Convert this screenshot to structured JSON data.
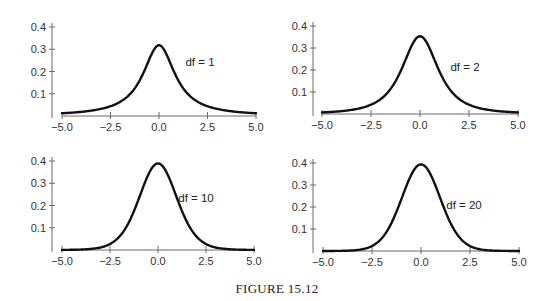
{
  "figure": {
    "caption": "FIGURE 15.12"
  },
  "chart_data": [
    {
      "type": "line",
      "title": "",
      "annotation": "df = 1",
      "df": 1,
      "distribution": "Student t density",
      "xlabel": "",
      "ylabel": "",
      "xlim": [
        -5.0,
        5.0
      ],
      "ylim": [
        0,
        0.4
      ],
      "x_ticks": [
        -5.0,
        -2.5,
        0.0,
        2.5,
        5.0
      ],
      "x_tick_labels": [
        "−5.0",
        "−2.5",
        "0.0",
        "2.5",
        "5.0"
      ],
      "y_ticks": [
        0.1,
        0.2,
        0.3,
        0.4
      ],
      "y_tick_labels": [
        "0.1",
        "0.2",
        "0.3",
        "0.4"
      ],
      "grid": false,
      "legend": "none",
      "x": [
        -5.0,
        -4.0,
        -3.0,
        -2.5,
        -2.0,
        -1.5,
        -1.0,
        -0.5,
        0.0,
        0.5,
        1.0,
        1.5,
        2.0,
        2.5,
        3.0,
        4.0,
        5.0
      ],
      "y": [
        0.012,
        0.019,
        0.032,
        0.044,
        0.064,
        0.098,
        0.159,
        0.255,
        0.318,
        0.255,
        0.159,
        0.098,
        0.064,
        0.044,
        0.032,
        0.019,
        0.012
      ]
    },
    {
      "type": "line",
      "title": "",
      "annotation": "df = 2",
      "df": 2,
      "distribution": "Student t density",
      "xlabel": "",
      "ylabel": "",
      "xlim": [
        -5.0,
        5.0
      ],
      "ylim": [
        0,
        0.4
      ],
      "x_ticks": [
        -5.0,
        -2.5,
        0.0,
        2.5,
        5.0
      ],
      "x_tick_labels": [
        "−5.0",
        "−2.5",
        "0.0",
        "2.5",
        "5.0"
      ],
      "y_ticks": [
        0.1,
        0.2,
        0.3,
        0.4
      ],
      "y_tick_labels": [
        "0.1",
        "0.2",
        "0.3",
        "0.4"
      ],
      "grid": false,
      "legend": "none",
      "x": [
        -5.0,
        -4.0,
        -3.0,
        -2.5,
        -2.0,
        -1.5,
        -1.0,
        -0.5,
        0.0,
        0.5,
        1.0,
        1.5,
        2.0,
        2.5,
        3.0,
        4.0,
        5.0
      ],
      "y": [
        0.007,
        0.013,
        0.027,
        0.042,
        0.068,
        0.117,
        0.192,
        0.299,
        0.354,
        0.299,
        0.192,
        0.117,
        0.068,
        0.042,
        0.027,
        0.013,
        0.007
      ]
    },
    {
      "type": "line",
      "title": "",
      "annotation": "df = 10",
      "df": 10,
      "distribution": "Student t density",
      "xlabel": "",
      "ylabel": "",
      "xlim": [
        -5.0,
        5.0
      ],
      "ylim": [
        0,
        0.4
      ],
      "x_ticks": [
        -5.0,
        -2.5,
        0.0,
        2.5,
        5.0
      ],
      "x_tick_labels": [
        "−5.0",
        "−2.5",
        "0.0",
        "2.5",
        "5.0"
      ],
      "y_ticks": [
        0.1,
        0.2,
        0.3,
        0.4
      ],
      "y_tick_labels": [
        "0.1",
        "0.2",
        "0.3",
        "0.4"
      ],
      "grid": false,
      "legend": "none",
      "x": [
        -5.0,
        -4.0,
        -3.0,
        -2.5,
        -2.0,
        -1.5,
        -1.0,
        -0.5,
        0.0,
        0.5,
        1.0,
        1.5,
        2.0,
        2.5,
        3.0,
        4.0,
        5.0
      ],
      "y": [
        0.0,
        0.002,
        0.011,
        0.025,
        0.061,
        0.127,
        0.23,
        0.34,
        0.389,
        0.34,
        0.23,
        0.127,
        0.061,
        0.025,
        0.011,
        0.002,
        0.0
      ]
    },
    {
      "type": "line",
      "title": "",
      "annotation": "df = 20",
      "df": 20,
      "distribution": "Student t density",
      "xlabel": "",
      "ylabel": "",
      "xlim": [
        -5.0,
        5.0
      ],
      "ylim": [
        0,
        0.4
      ],
      "x_ticks": [
        -5.0,
        -2.5,
        0.0,
        2.5,
        5.0
      ],
      "x_tick_labels": [
        "−5.0",
        "−2.5",
        "0.0",
        "2.5",
        "5.0"
      ],
      "y_ticks": [
        0.1,
        0.2,
        0.3,
        0.4
      ],
      "y_tick_labels": [
        "0.1",
        "0.2",
        "0.3",
        "0.4"
      ],
      "grid": false,
      "legend": "none",
      "x": [
        -5.0,
        -4.0,
        -3.0,
        -2.5,
        -2.0,
        -1.5,
        -1.0,
        -0.5,
        0.0,
        0.5,
        1.0,
        1.5,
        2.0,
        2.5,
        3.0,
        4.0,
        5.0
      ],
      "y": [
        0.0,
        0.001,
        0.007,
        0.021,
        0.058,
        0.128,
        0.236,
        0.347,
        0.394,
        0.347,
        0.236,
        0.128,
        0.058,
        0.021,
        0.007,
        0.001,
        0.0
      ]
    }
  ]
}
